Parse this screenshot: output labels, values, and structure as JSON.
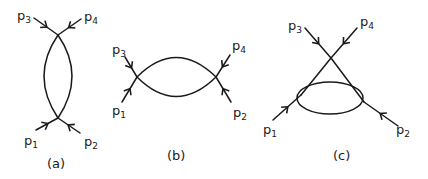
{
  "diagrams": [
    {
      "id": "a",
      "caption": "(a)",
      "labels": {
        "p1": {
          "base": "p",
          "sub": "1"
        },
        "p2": {
          "base": "p",
          "sub": "2"
        },
        "p3": {
          "base": "p",
          "sub": "3"
        },
        "p4": {
          "base": "p",
          "sub": "4"
        }
      }
    },
    {
      "id": "b",
      "caption": "(b)",
      "labels": {
        "p1": {
          "base": "p",
          "sub": "1"
        },
        "p2": {
          "base": "p",
          "sub": "2"
        },
        "p3": {
          "base": "p",
          "sub": "3"
        },
        "p4": {
          "base": "p",
          "sub": "4"
        }
      }
    },
    {
      "id": "c",
      "caption": "(c)",
      "labels": {
        "p1": {
          "base": "p",
          "sub": "1"
        },
        "p2": {
          "base": "p",
          "sub": "2"
        },
        "p3": {
          "base": "p",
          "sub": "3"
        },
        "p4": {
          "base": "p",
          "sub": "4"
        }
      }
    }
  ],
  "colors": {
    "ink": "#1a1a1a",
    "background": "#ffffff"
  }
}
